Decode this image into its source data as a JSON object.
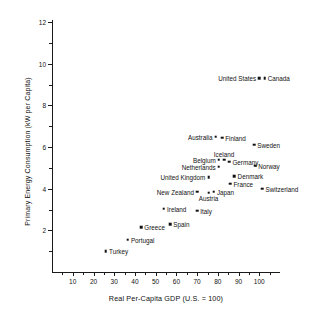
{
  "chart_data": {
    "type": "scatter",
    "title": "",
    "xlabel": "Real Per-Capita GDP (U.S.  =  100)",
    "ylabel": "Primary Energy Consumption (kW per Capita)",
    "xlim": [
      0,
      110
    ],
    "ylim": [
      0,
      12
    ],
    "xticks": [
      10,
      20,
      30,
      40,
      50,
      60,
      70,
      80,
      90,
      100
    ],
    "yticks": [
      2,
      4,
      6,
      8,
      10,
      12
    ],
    "xminorticks": [
      5,
      15,
      25,
      35,
      45,
      55,
      65,
      75,
      85,
      95,
      105
    ],
    "yminorticks": [
      1,
      3,
      5,
      7,
      9,
      11
    ],
    "grid": false,
    "legend": false,
    "points": [
      {
        "name": "United States",
        "x": 100,
        "y": 9.3,
        "label_pos": "left"
      },
      {
        "name": "Canada",
        "x": 102.5,
        "y": 9.3,
        "label_pos": "right"
      },
      {
        "name": "Australia",
        "x": 79,
        "y": 6.5,
        "label_pos": "left"
      },
      {
        "name": "Finland",
        "x": 82,
        "y": 6.45,
        "label_pos": "right"
      },
      {
        "name": "Sweden",
        "x": 97.5,
        "y": 6.1,
        "label_pos": "right"
      },
      {
        "name": "Iceland",
        "x": 83,
        "y": 5.4,
        "label_pos": "above"
      },
      {
        "name": "Belgium",
        "x": 80.5,
        "y": 5.4,
        "label_pos": "left"
      },
      {
        "name": "Germany",
        "x": 85.5,
        "y": 5.3,
        "label_pos": "right"
      },
      {
        "name": "Netherlands",
        "x": 80.5,
        "y": 5.05,
        "label_pos": "left"
      },
      {
        "name": "Norway",
        "x": 98,
        "y": 5.1,
        "label_pos": "right"
      },
      {
        "name": "Denmark",
        "x": 88,
        "y": 4.6,
        "label_pos": "right"
      },
      {
        "name": "United Kingdom",
        "x": 75.5,
        "y": 4.55,
        "label_pos": "left"
      },
      {
        "name": "France",
        "x": 86,
        "y": 4.25,
        "label_pos": "right"
      },
      {
        "name": "Switzerland",
        "x": 101.5,
        "y": 4.0,
        "label_pos": "right"
      },
      {
        "name": "New Zealand",
        "x": 70,
        "y": 3.85,
        "label_pos": "left"
      },
      {
        "name": "Austria",
        "x": 75.5,
        "y": 3.8,
        "label_pos": "below"
      },
      {
        "name": "Japan",
        "x": 78,
        "y": 3.85,
        "label_pos": "right"
      },
      {
        "name": "Ireland",
        "x": 54,
        "y": 3.05,
        "label_pos": "right"
      },
      {
        "name": "Italy",
        "x": 70,
        "y": 2.95,
        "label_pos": "right"
      },
      {
        "name": "Spain",
        "x": 57,
        "y": 2.3,
        "label_pos": "right"
      },
      {
        "name": "Greece",
        "x": 43,
        "y": 2.15,
        "label_pos": "right"
      },
      {
        "name": "Portugal",
        "x": 36.5,
        "y": 1.55,
        "label_pos": "right"
      },
      {
        "name": "Turkey",
        "x": 26,
        "y": 1.0,
        "label_pos": "right"
      }
    ]
  }
}
